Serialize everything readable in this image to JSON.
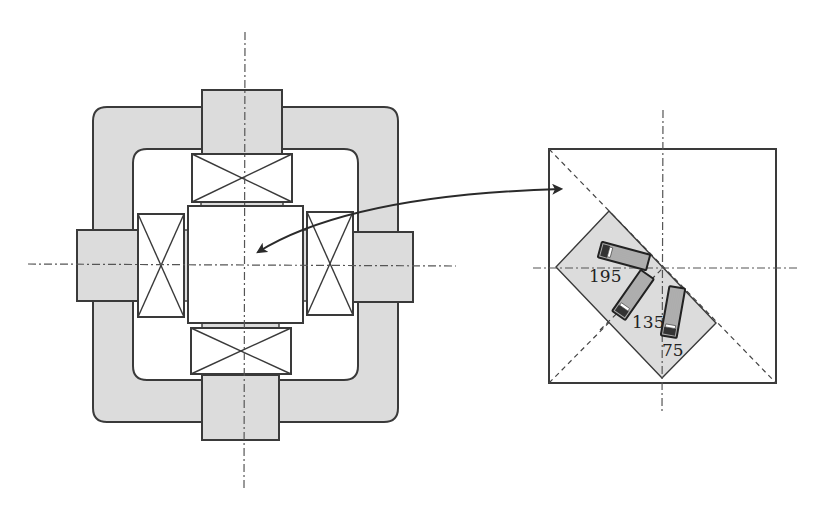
{
  "figure": {
    "left_view": {
      "description": "Quadrupole magnet cross-section with yoke, four poles and four coils around a central cavity"
    },
    "right_view": {
      "description": "Enlarged square region with diagonal mount holding three rotated chips"
    },
    "chips": [
      {
        "label": "195",
        "angle_deg": 195
      },
      {
        "label": "135",
        "angle_deg": 135
      },
      {
        "label": "75",
        "angle_deg": 75
      }
    ],
    "arrow": {
      "type": "double-headed curved arrow",
      "connects": "center cavity to enlarged view"
    }
  },
  "colors": {
    "yoke_fill": "#dcdcdc",
    "outline": "#3a3a3a",
    "background": "#ffffff"
  }
}
